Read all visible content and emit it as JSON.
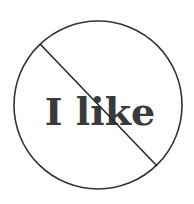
{
  "sign": {
    "text": "I like",
    "symbol": "prohibition-sign",
    "colors": {
      "background": "#ffffff",
      "stroke": "#333333",
      "text": "#3a3a3a"
    }
  }
}
